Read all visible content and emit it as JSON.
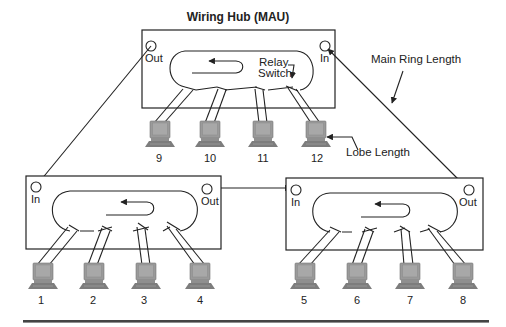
{
  "diagram": {
    "title": "Wiring Hub (MAU)",
    "annotations": {
      "relay_switch_line1": "Relay",
      "relay_switch_line2": "Switch",
      "main_ring_length": "Main Ring Length",
      "lobe_length": "Lobe Length"
    },
    "hubs": [
      {
        "id": "top",
        "port_out": "Out",
        "port_in": "In",
        "stations": [
          "9",
          "10",
          "11",
          "12"
        ]
      },
      {
        "id": "bottom-left",
        "port_in": "In",
        "port_out": "Out",
        "stations": [
          "1",
          "2",
          "3",
          "4"
        ]
      },
      {
        "id": "bottom-right",
        "port_in": "In",
        "port_out": "Out",
        "stations": [
          "5",
          "6",
          "7",
          "8"
        ]
      }
    ],
    "colors": {
      "line": "#222222",
      "computer": "#9a9a9a",
      "divider": "#444444"
    }
  }
}
